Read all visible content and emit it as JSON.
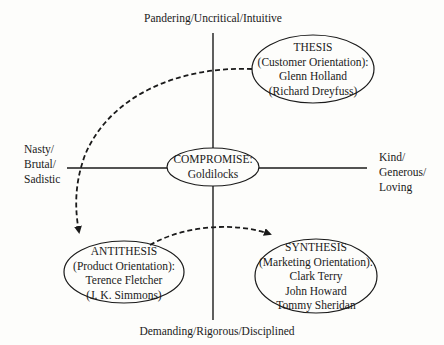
{
  "axes": {
    "top": "Pandering/Uncritical/Intuitive",
    "bottom": "Demanding/Rigorous/Disciplined",
    "left": [
      "Nasty/",
      "Brutal/",
      "Sadistic"
    ],
    "right": [
      "Kind/",
      "Generous/",
      "Loving"
    ]
  },
  "nodes": {
    "thesis": {
      "title": "THESIS",
      "subtitle": "(Customer Orientation):",
      "lines": [
        "Glenn Holland",
        "(Richard Dreyfuss)"
      ]
    },
    "compromise": {
      "title": "COMPROMISE:",
      "lines": [
        "Goldilocks"
      ]
    },
    "antithesis": {
      "title": "ANTITHESIS",
      "subtitle": "(Product Orientation):",
      "lines": [
        "Terence Fletcher",
        "(J. K. Simmons)"
      ]
    },
    "synthesis": {
      "title": "SYNTHESIS",
      "subtitle": "(Marketing Orientation):",
      "lines": [
        "Clark Terry",
        "John Howard",
        "Tommy Sheridan"
      ]
    }
  },
  "arrows": [
    {
      "from": "thesis",
      "to": "antithesis",
      "style": "dashed"
    },
    {
      "from": "antithesis",
      "to": "synthesis",
      "style": "dashed"
    }
  ],
  "colors": {
    "stroke": "#1a1a1a",
    "background": "#fdfdfb"
  }
}
